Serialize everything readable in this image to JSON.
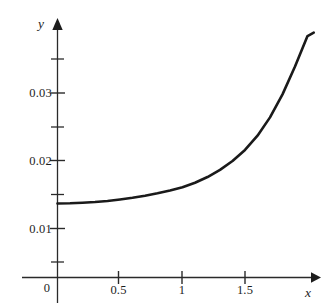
{
  "figure": {
    "background_color": "#ffffff",
    "ink_color": "#1d1d1d",
    "curve_color": "#1a1a1a"
  },
  "axes": {
    "x_axis_label": "x",
    "y_axis_label": "y",
    "origin_label": "0"
  },
  "chart_data": {
    "type": "line",
    "title": "",
    "subtitle": "",
    "xlabel": "x",
    "ylabel": "y",
    "xlim": [
      0,
      2.05
    ],
    "ylim": [
      0,
      0.0395
    ],
    "grid": false,
    "legend": null,
    "x_ticks_major": [
      0,
      0.5,
      1,
      1.5
    ],
    "x_tick_labels": [
      "0",
      "0.5",
      "1",
      "1.5"
    ],
    "y_ticks_major": [
      0.01,
      0.02,
      0.03
    ],
    "y_tick_labels": [
      "0.01",
      "0.02",
      "0.03"
    ],
    "y_ticks_minor": [
      0.005,
      0.015,
      0.025,
      0.035
    ],
    "axis_arrows": [
      "x-right",
      "y-up"
    ],
    "series": [
      {
        "name": "curve",
        "x": [
          0.0,
          0.1,
          0.2,
          0.3,
          0.4,
          0.5,
          0.6,
          0.7,
          0.8,
          0.9,
          1.0,
          1.1,
          1.2,
          1.3,
          1.4,
          1.5,
          1.6,
          1.7,
          1.8,
          1.9,
          2.0,
          2.05
        ],
        "y": [
          0.01368,
          0.01372,
          0.0138,
          0.01391,
          0.01407,
          0.01428,
          0.01453,
          0.01484,
          0.0152,
          0.01562,
          0.0161,
          0.01676,
          0.0176,
          0.01866,
          0.01996,
          0.0216,
          0.0237,
          0.0264,
          0.0298,
          0.0339,
          0.0384,
          0.0389
        ]
      }
    ]
  },
  "ticks": {
    "y_labels": [
      {
        "text": "0.03",
        "value": 0.03
      },
      {
        "text": "0.02",
        "value": 0.02
      },
      {
        "text": "0.01",
        "value": 0.01
      }
    ],
    "x_labels": [
      {
        "text": "0.5",
        "value": 0.5
      },
      {
        "text": "1",
        "value": 1
      },
      {
        "text": "1.5",
        "value": 1.5
      }
    ]
  }
}
